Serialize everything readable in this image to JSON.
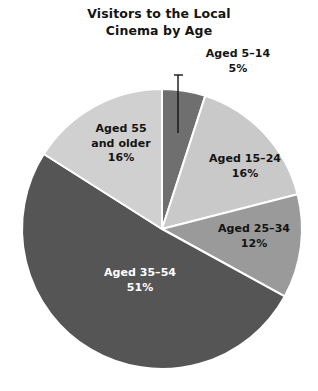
{
  "chart_data": {
    "type": "pie",
    "title": "Visitors to the Local Cinema by Age",
    "title_lines": [
      "Visitors to the Local",
      "Cinema by Age"
    ],
    "xlabel": "",
    "ylabel": "",
    "legend": "none",
    "grid": false,
    "units": "percent",
    "total": 100,
    "start_angle_deg": 0,
    "direction": "clockwise",
    "categories": [
      "Aged 5–14",
      "Aged 15–24",
      "Aged 25–34",
      "Aged 35–54",
      "Aged 55 and older"
    ],
    "values": [
      5,
      16,
      12,
      51,
      16
    ],
    "slices": [
      {
        "name": "aged-5-14",
        "label_lines": [
          "Aged 5–14",
          "5%"
        ],
        "category": "Aged 5–14",
        "value": 5,
        "value_text": "5%",
        "color": "#6f6f6f",
        "label_color": "#141414",
        "has_leader_line": true
      },
      {
        "name": "aged-15-24",
        "label_lines": [
          "Aged 15–24",
          "16%"
        ],
        "category": "Aged 15–24",
        "value": 16,
        "value_text": "16%",
        "color": "#c9c9c9",
        "label_color": "#141414",
        "has_leader_line": false
      },
      {
        "name": "aged-25-34",
        "label_lines": [
          "Aged 25–34",
          "12%"
        ],
        "category": "Aged 25–34",
        "value": 12,
        "value_text": "12%",
        "color": "#9a9a9a",
        "label_color": "#141414",
        "has_leader_line": false
      },
      {
        "name": "aged-35-54",
        "label_lines": [
          "Aged 35–54",
          "51%"
        ],
        "category": "Aged 35–54",
        "value": 51,
        "value_text": "51%",
        "color": "#555555",
        "label_color": "#ffffff",
        "has_leader_line": false
      },
      {
        "name": "aged-55-and-older",
        "label_lines": [
          "Aged 55",
          "and older",
          "16%"
        ],
        "category": "Aged 55 and older",
        "value": 16,
        "value_text": "16%",
        "color": "#d0d0d0",
        "label_color": "#141414",
        "has_leader_line": false
      }
    ],
    "separator_color": "#ffffff",
    "background": "#ffffff"
  }
}
